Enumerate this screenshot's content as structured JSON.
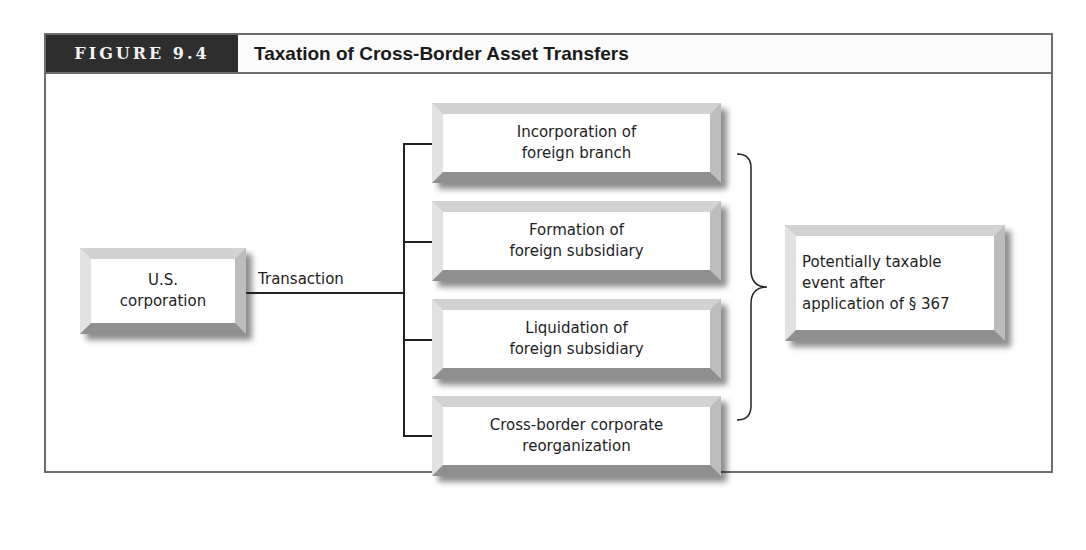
{
  "figure": {
    "label": "FIGURE 9.4",
    "title": "Taxation of Cross-Border Asset Transfers"
  },
  "diagram": {
    "source": {
      "lines": [
        "U.S.",
        "corporation"
      ]
    },
    "connector_label": "Transaction",
    "transactions": [
      {
        "lines": [
          "Incorporation of",
          "foreign branch"
        ]
      },
      {
        "lines": [
          "Formation of",
          "foreign subsidiary"
        ]
      },
      {
        "lines": [
          "Liquidation of",
          "foreign subsidiary"
        ]
      },
      {
        "lines": [
          "Cross-border corporate",
          "reorganization"
        ]
      }
    ],
    "result": {
      "lines": [
        "Potentially taxable",
        "event after",
        "application of § 367"
      ]
    }
  },
  "colors": {
    "label_bg": "#2e2e2e",
    "frame_border": "#6d6d6d",
    "text": "#1e1e1e"
  }
}
